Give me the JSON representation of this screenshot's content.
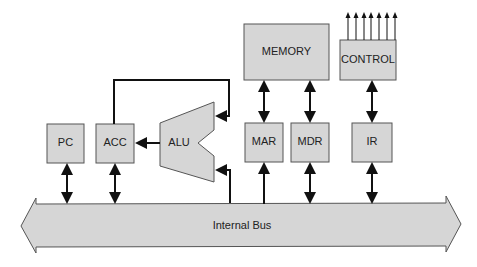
{
  "diagram": {
    "title": "",
    "colors": {
      "box_fill": "#d6d6d6",
      "box_stroke": "#555555",
      "arrow": "#111111",
      "background": "#ffffff"
    },
    "nodes": {
      "pc": "PC",
      "acc": "ACC",
      "alu": "ALU",
      "memory": "MEMORY",
      "control": "CONTROL",
      "mar": "MAR",
      "mdr": "MDR",
      "ir": "IR",
      "bus": "Internal Bus"
    },
    "edges": [
      {
        "from": "PC",
        "to": "Internal Bus",
        "type": "bidirectional"
      },
      {
        "from": "ACC",
        "to": "Internal Bus",
        "type": "bidirectional"
      },
      {
        "from": "ACC",
        "to": "ALU",
        "type": "directed",
        "note": "feedback loop to ALU upper input"
      },
      {
        "from": "Internal Bus",
        "to": "ALU",
        "type": "directed",
        "note": "ALU lower input"
      },
      {
        "from": "ALU",
        "to": "ACC",
        "type": "directed"
      },
      {
        "from": "MEMORY",
        "to": "MAR",
        "type": "bidirectional"
      },
      {
        "from": "MEMORY",
        "to": "MDR",
        "type": "bidirectional"
      },
      {
        "from": "Internal Bus",
        "to": "MAR",
        "type": "directed"
      },
      {
        "from": "MDR",
        "to": "Internal Bus",
        "type": "bidirectional"
      },
      {
        "from": "CONTROL",
        "to": "IR",
        "type": "bidirectional"
      },
      {
        "from": "IR",
        "to": "Internal Bus",
        "type": "bidirectional"
      },
      {
        "from": "CONTROL",
        "to": "control-outputs",
        "type": "directed",
        "count": 7
      }
    ]
  }
}
